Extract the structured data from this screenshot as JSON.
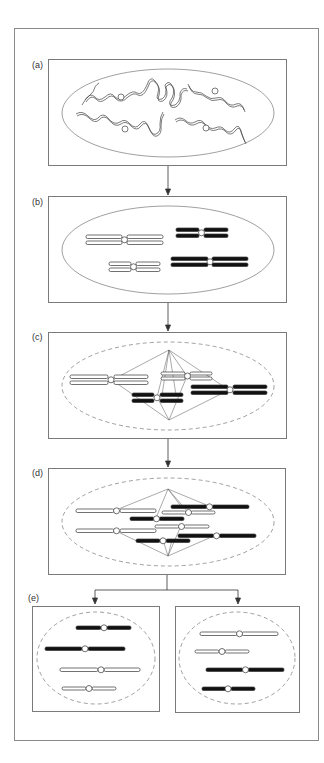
{
  "figure": {
    "panels": [
      {
        "id": "a",
        "label": "(a)",
        "stage": "interphase chromatin"
      },
      {
        "id": "b",
        "label": "(b)",
        "stage": "prophase condensed chromosomes"
      },
      {
        "id": "c",
        "label": "(c)",
        "stage": "prometaphase spindle attachment"
      },
      {
        "id": "d",
        "label": "(d)",
        "stage": "anaphase separation"
      },
      {
        "id": "e",
        "label": "(e)",
        "stage": "two daughter nuclei"
      }
    ],
    "colors": {
      "line": "#555555",
      "filled_chromosome": "#111111",
      "open_chromosome": "#ffffff",
      "frame": "#8a8a8a"
    }
  }
}
